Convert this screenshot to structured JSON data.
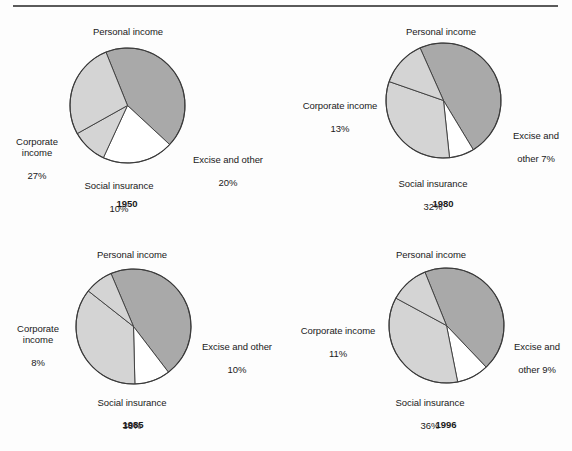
{
  "figure": {
    "rule_label": "horizontal-divider",
    "slice_labels": {
      "personal": "Personal income",
      "corporate_one_line": "Corporate income",
      "corporate_two_line": "Corporate\nincome",
      "social": "Social insurance",
      "excise_one_line": "Excise and other",
      "excise_two_line": "Excise and\nother"
    }
  },
  "chart_data": [
    {
      "type": "pie",
      "title": "1950",
      "categories": [
        "Personal income",
        "Excise and other",
        "Social insurance",
        "Corporate income"
      ],
      "values": [
        43,
        20,
        10,
        27
      ],
      "colors": [
        "#a9a9a9",
        "#ffffff",
        "#d4d4d4",
        "#d4d4d4"
      ],
      "start_angle_deg": -22,
      "labels": [
        {
          "name": "personal",
          "text": "Personal income",
          "value": "43%"
        },
        {
          "name": "excise",
          "text": "Excise and other",
          "value": "20%"
        },
        {
          "name": "social",
          "text": "Social insurance",
          "value": "10%"
        },
        {
          "name": "corporate",
          "text": "Corporate\nincome",
          "value": "27%"
        }
      ]
    },
    {
      "type": "pie",
      "title": "1980",
      "categories": [
        "Personal income",
        "Excise and other",
        "Social insurance",
        "Corporate income"
      ],
      "values": [
        48,
        7,
        32,
        13
      ],
      "colors": [
        "#a9a9a9",
        "#ffffff",
        "#d4d4d4",
        "#d4d4d4"
      ],
      "start_angle_deg": -24,
      "labels": [
        {
          "name": "personal",
          "text": "Personal income",
          "value": "48%"
        },
        {
          "name": "excise",
          "text": "Excise and\nother 7%",
          "value": ""
        },
        {
          "name": "social",
          "text": "Social insurance",
          "value": "32%"
        },
        {
          "name": "corporate",
          "text": "Corporate income",
          "value": "13%"
        }
      ]
    },
    {
      "type": "pie",
      "title": "1985",
      "categories": [
        "Personal income",
        "Excise and other",
        "Social insurance",
        "Corporate income"
      ],
      "values": [
        46,
        10,
        36,
        8
      ],
      "colors": [
        "#a9a9a9",
        "#ffffff",
        "#d4d4d4",
        "#d4d4d4"
      ],
      "start_angle_deg": -23,
      "labels": [
        {
          "name": "personal",
          "text": "Personal income",
          "value": "46%"
        },
        {
          "name": "excise",
          "text": "Excise and other",
          "value": "10%"
        },
        {
          "name": "social",
          "text": "Social insurance",
          "value": "36%"
        },
        {
          "name": "corporate",
          "text": "Corporate\nincome",
          "value": "8%"
        }
      ]
    },
    {
      "type": "pie",
      "title": "1996",
      "categories": [
        "Personal income",
        "Excise and other",
        "Social insurance",
        "Corporate income"
      ],
      "values": [
        44,
        9,
        36,
        11
      ],
      "colors": [
        "#a9a9a9",
        "#ffffff",
        "#d4d4d4",
        "#d4d4d4"
      ],
      "start_angle_deg": -22,
      "labels": [
        {
          "name": "personal",
          "text": "Personal income",
          "value": "44%"
        },
        {
          "name": "excise",
          "text": "Excise and\nother 9%",
          "value": ""
        },
        {
          "name": "social",
          "text": "Social insurance",
          "value": "36%"
        },
        {
          "name": "corporate",
          "text": "Corporate income",
          "value": "11%"
        }
      ]
    }
  ],
  "charts": {
    "c0": {
      "year": "1950",
      "personal_text": "Personal income",
      "personal_pct": "43%",
      "corporate_text": "Corporate\nincome",
      "corporate_pct": "27%",
      "social_text": "Social insurance",
      "social_pct": "10%",
      "excise_text": "Excise and other",
      "excise_pct": "20%"
    },
    "c1": {
      "year": "1980",
      "personal_text": "Personal income",
      "personal_pct": "48%",
      "corporate_text": "Corporate income",
      "corporate_pct": "13%",
      "social_text": "Social insurance",
      "social_pct": "32%",
      "excise_text": "Excise and",
      "excise_pct": "other 7%"
    },
    "c2": {
      "year": "1985",
      "personal_text": "Personal income",
      "personal_pct": "46%",
      "corporate_text": "Corporate\nincome",
      "corporate_pct": "8%",
      "social_text": "Social insurance",
      "social_pct": "36%",
      "excise_text": "Excise and other",
      "excise_pct": "10%"
    },
    "c3": {
      "year": "1996",
      "personal_text": "Personal income",
      "personal_pct": "44%",
      "corporate_text": "Corporate income",
      "corporate_pct": "11%",
      "social_text": "Social insurance",
      "social_pct": "36%",
      "excise_text": "Excise and",
      "excise_pct": "other 9%"
    }
  }
}
